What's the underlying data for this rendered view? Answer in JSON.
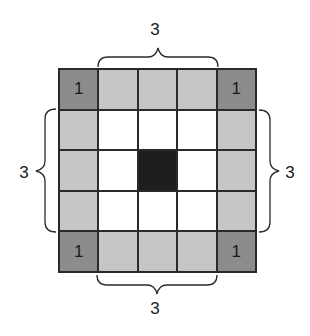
{
  "diagram": {
    "title": "",
    "grid": {
      "rows": 5,
      "cols": 5,
      "colors": {
        "corner": "#8c8c8c",
        "edge": "#c6c6c6",
        "interior": "#ffffff",
        "center": "#1e1e1e",
        "line": "#2a2a2a"
      },
      "cells": [
        [
          {
            "type": "corner",
            "label": "1"
          },
          {
            "type": "edge",
            "label": ""
          },
          {
            "type": "edge",
            "label": ""
          },
          {
            "type": "edge",
            "label": ""
          },
          {
            "type": "corner",
            "label": "1"
          }
        ],
        [
          {
            "type": "edge",
            "label": ""
          },
          {
            "type": "interior",
            "label": ""
          },
          {
            "type": "interior",
            "label": ""
          },
          {
            "type": "interior",
            "label": ""
          },
          {
            "type": "edge",
            "label": ""
          }
        ],
        [
          {
            "type": "edge",
            "label": ""
          },
          {
            "type": "interior",
            "label": ""
          },
          {
            "type": "center",
            "label": ""
          },
          {
            "type": "interior",
            "label": ""
          },
          {
            "type": "edge",
            "label": ""
          }
        ],
        [
          {
            "type": "edge",
            "label": ""
          },
          {
            "type": "interior",
            "label": ""
          },
          {
            "type": "interior",
            "label": ""
          },
          {
            "type": "interior",
            "label": ""
          },
          {
            "type": "edge",
            "label": ""
          }
        ],
        [
          {
            "type": "corner",
            "label": "1"
          },
          {
            "type": "edge",
            "label": ""
          },
          {
            "type": "edge",
            "label": ""
          },
          {
            "type": "edge",
            "label": ""
          },
          {
            "type": "corner",
            "label": "1"
          }
        ]
      ]
    },
    "braces": {
      "top": {
        "label": "3"
      },
      "bottom": {
        "label": "3"
      },
      "left": {
        "label": "3"
      },
      "right": {
        "label": "3"
      }
    }
  }
}
